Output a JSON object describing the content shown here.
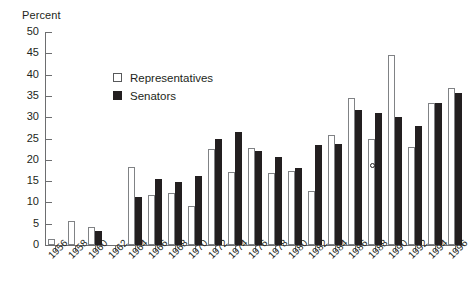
{
  "chart_data": {
    "type": "bar",
    "title": "",
    "subtitle": "",
    "xlabel": "",
    "ylabel": "Percent",
    "ylim": [
      0,
      50
    ],
    "ytick_step": 5,
    "yticks": [
      0,
      5,
      10,
      15,
      20,
      25,
      30,
      35,
      40,
      45,
      50
    ],
    "ytick_labels": [
      "0",
      "5",
      "10",
      "15",
      "20",
      "25",
      "30",
      "35",
      "40",
      "45",
      "50"
    ],
    "grid": false,
    "legend_position": "upper-left-inside",
    "categories": [
      "1956",
      "1958",
      "1960",
      "1962",
      "1964",
      "1966",
      "1968",
      "1970",
      "1972",
      "1974",
      "1976",
      "1978",
      "1980",
      "1982",
      "1984",
      "1986",
      "1988",
      "1990",
      "1992",
      "1994",
      "1996"
    ],
    "series": [
      {
        "name": "Representatives",
        "color": "#ffffff",
        "edge_color": "#808285",
        "values": [
          1.5,
          5.7,
          4.2,
          0,
          18.3,
          11.7,
          12.3,
          9.1,
          22.5,
          17.1,
          22.8,
          17.0,
          17.3,
          12.6,
          25.8,
          34.5,
          24.9,
          44.5,
          23.0,
          33.4,
          36.8
        ]
      },
      {
        "name": "Senators",
        "color": "#231f20",
        "edge_color": "#231f20",
        "values": [
          0,
          0,
          3.3,
          0,
          11.3,
          15.4,
          14.9,
          16.1,
          25.0,
          26.6,
          22.1,
          20.6,
          18.0,
          23.5,
          23.7,
          31.7,
          31.0,
          30.0,
          27.9,
          33.3,
          35.6
        ]
      }
    ],
    "annotations": [
      {
        "name": "marker-dot",
        "x": "1988",
        "value": 18.8,
        "shape": "circle"
      }
    ]
  },
  "axis": {
    "y_title": "Percent"
  },
  "legend": {
    "items": [
      {
        "label": "Representatives",
        "swatch": "open-square-swatch"
      },
      {
        "label": "Senators",
        "swatch": "filled-square-swatch"
      }
    ]
  }
}
